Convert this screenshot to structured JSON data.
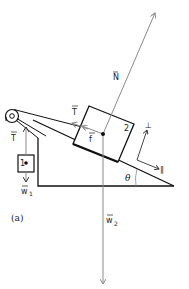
{
  "diagram": {
    "panel_label": "(a)",
    "block1_label": "1",
    "block2_label": "2",
    "labels": {
      "normal_force": "N",
      "tension_block2": "T",
      "friction": "f",
      "tension_block1": "T",
      "weight1": "w",
      "weight1_sub": "1",
      "weight2": "w",
      "weight2_sub": "2",
      "angle": "θ",
      "perp_axis": "⊥",
      "parallel_axis": "∥"
    },
    "colors": {
      "ink": "#111111",
      "force_arrow": "#8a8a8a"
    }
  }
}
